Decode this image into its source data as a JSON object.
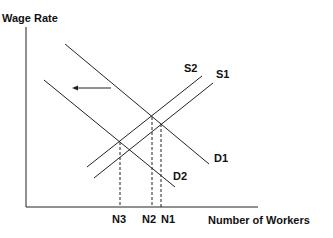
{
  "diagram": {
    "y_axis_label": "Wage Rate",
    "x_axis_label": "Number of Workers",
    "curves": {
      "S1": "S1",
      "S2": "S2",
      "D1": "D1",
      "D2": "D2"
    },
    "quantities": {
      "N1": "N1",
      "N2": "N2",
      "N3": "N3"
    },
    "shift_arrow": "demand shift left (D1 to D2)",
    "line_color": "#222222"
  }
}
